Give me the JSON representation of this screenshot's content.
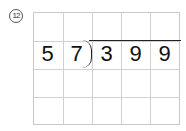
{
  "problem": {
    "number_label": "12",
    "divisor": [
      "5",
      "7"
    ],
    "dividend": [
      "3",
      "9",
      "9"
    ]
  },
  "grid": {
    "columns": 5,
    "rows": 4
  }
}
